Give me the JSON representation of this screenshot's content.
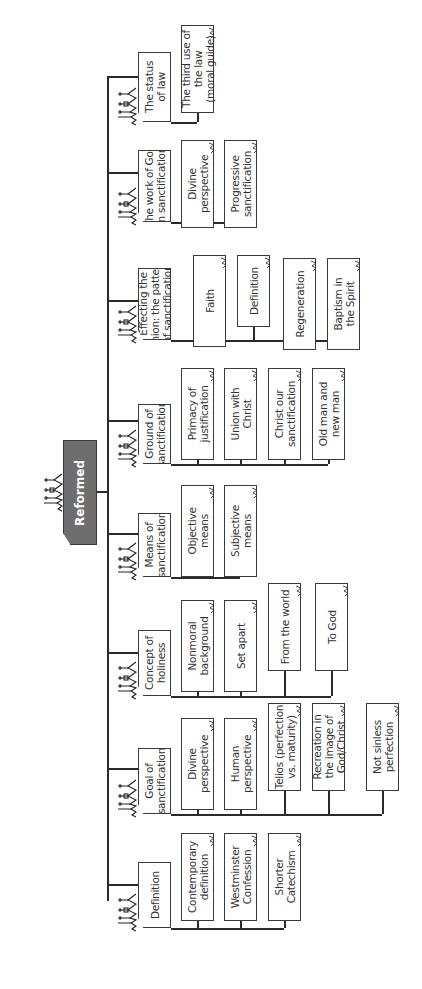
{
  "root": {
    "label": "Reformed",
    "icon": "church-skyline-icon",
    "fill": "#6e6e6e"
  },
  "categories": [
    {
      "label": "The status\nof law",
      "children": [
        "The third use of\nthe law\n(moral guide)"
      ]
    },
    {
      "label": "The work of God\nin sanctification",
      "children": [
        "Divine\nperspective",
        "Progressive\nsanctification"
      ]
    },
    {
      "label": "Effecting the\nunion: the pattern\nof sanctification",
      "children": [
        "Faith",
        "Definition",
        "Regeneration",
        "Baptism in\nthe Spirit"
      ]
    },
    {
      "label": "Ground of\nsanctification",
      "children": [
        "Primacy of\njustification",
        "Union with\nChrist",
        "Christ our\nsanctification",
        "Old man and\nnew man"
      ]
    },
    {
      "label": "Means of\nsanctification",
      "children": [
        "Objective\nmeans",
        "Subjective\nmeans"
      ]
    },
    {
      "label": "Concept of\nholiness",
      "children": [
        "Nonmoral\nbackground",
        "Set apart",
        "From the world",
        "To God"
      ]
    },
    {
      "label": "Goal of\nsanctification",
      "children": [
        "Divine\nperspective",
        "Human\nperspective",
        "Telios (perfection\nvs. maturity)",
        "Recreation in\nthe image of\nGod/Christ",
        "Not sinless\nperfection"
      ]
    },
    {
      "label": "Definition",
      "children": [
        "Contemporary\ndefinition",
        "Westminster\nConfession",
        "Shorter\nCatechism"
      ]
    }
  ],
  "colors": {
    "line": "#2a2a2a",
    "box_border": "#3a3a3a",
    "text": "#333333",
    "background": "#ffffff"
  }
}
